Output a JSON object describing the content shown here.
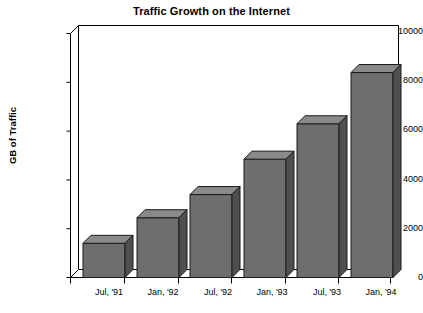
{
  "chart_data": {
    "type": "bar",
    "title": "Traffic Growth on the Internet",
    "xlabel": "",
    "ylabel": "GB of Traffic",
    "categories": [
      "Jul, '91",
      "Jan, '92",
      "Jul, '92",
      "Jan, '93",
      "Jul, '93",
      "Jan, '94"
    ],
    "values": [
      1400,
      2450,
      3400,
      4850,
      6300,
      8400
    ],
    "ylim": [
      0,
      10000
    ],
    "yticks": [
      0,
      2000,
      4000,
      6000,
      8000,
      10000
    ],
    "ytick_labels": [
      "0",
      "2000",
      "4000",
      "6000",
      "8000",
      "10000"
    ],
    "grid": false,
    "legend": "none",
    "style": "3d-bar",
    "colors": {
      "bar_front": "#6e6e6e",
      "bar_top": "#8a8a8a",
      "bar_side": "#4f4f4f",
      "bar_outline": "#1a1a1a",
      "axis": "#000000",
      "background": "#ffffff",
      "text": "#000000"
    }
  }
}
